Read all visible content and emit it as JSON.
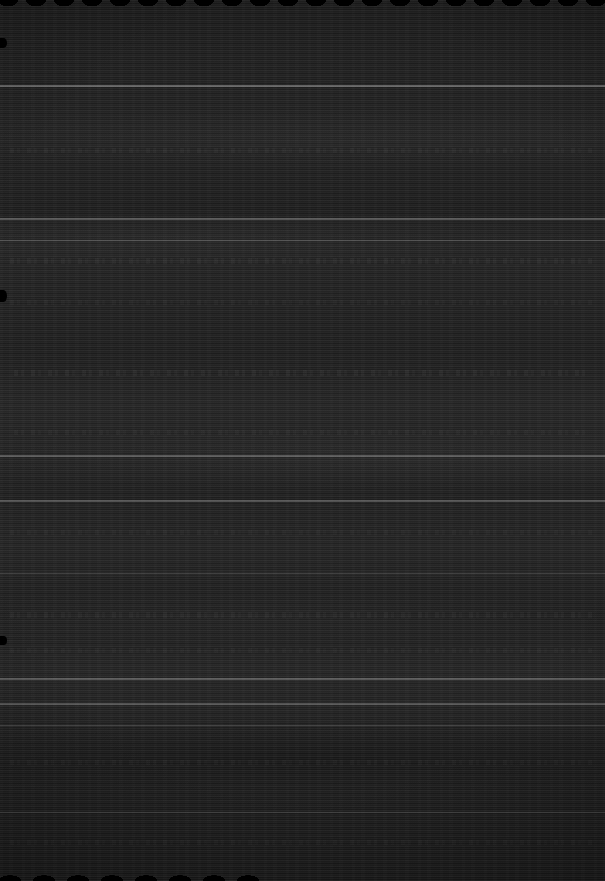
{
  "capture": {
    "width": 605,
    "height": 881,
    "description": "Severely underexposed / degraded screen capture. Surface is near-black with dense horizontal scan-line banding. No legible text, icons, buttons, or color accents are resolvable anywhere in the frame.",
    "legible_text": "",
    "background_color": "#1b1b1b",
    "darkest_color": "#0d0d0d",
    "brightest_color": "#3a3a3a"
  },
  "structure": {
    "separator_rules": [
      {
        "name": "rule-top",
        "y": 85,
        "height": 2,
        "opacity": 0.3
      },
      {
        "name": "rule-upper",
        "y": 218,
        "height": 2,
        "opacity": 0.26
      },
      {
        "name": "rule-upper-b",
        "y": 240,
        "height": 1,
        "opacity": 0.18
      },
      {
        "name": "rule-mid-a",
        "y": 455,
        "height": 2,
        "opacity": 0.24
      },
      {
        "name": "rule-mid-b",
        "y": 500,
        "height": 2,
        "opacity": 0.22
      },
      {
        "name": "rule-mid-c",
        "y": 573,
        "height": 1,
        "opacity": 0.16
      },
      {
        "name": "rule-lower-a",
        "y": 678,
        "height": 2,
        "opacity": 0.26
      },
      {
        "name": "rule-lower-b",
        "y": 703,
        "height": 2,
        "opacity": 0.24
      },
      {
        "name": "rule-lower-c",
        "y": 725,
        "height": 1,
        "opacity": 0.16
      },
      {
        "name": "rule-bottom",
        "y": 812,
        "height": 1,
        "opacity": 0.14
      }
    ],
    "texture_rows": [
      {
        "name": "texture-row-1",
        "y": 148,
        "x": 10,
        "width": 585,
        "height": 5,
        "opacity": 0.5
      },
      {
        "name": "texture-row-2",
        "y": 258,
        "x": 10,
        "width": 585,
        "height": 6,
        "opacity": 0.55
      },
      {
        "name": "texture-row-3",
        "y": 300,
        "x": 10,
        "width": 585,
        "height": 5,
        "opacity": 0.42
      },
      {
        "name": "texture-row-4",
        "y": 370,
        "x": 14,
        "width": 578,
        "height": 6,
        "opacity": 0.62
      },
      {
        "name": "texture-row-5",
        "y": 430,
        "x": 14,
        "width": 578,
        "height": 5,
        "opacity": 0.46
      },
      {
        "name": "texture-row-6",
        "y": 530,
        "x": 10,
        "width": 585,
        "height": 5,
        "opacity": 0.4
      },
      {
        "name": "texture-row-7",
        "y": 612,
        "x": 10,
        "width": 585,
        "height": 6,
        "opacity": 0.52
      },
      {
        "name": "texture-row-8",
        "y": 648,
        "x": 10,
        "width": 585,
        "height": 5,
        "opacity": 0.38
      },
      {
        "name": "texture-row-9",
        "y": 760,
        "x": 10,
        "width": 585,
        "height": 5,
        "opacity": 0.44
      },
      {
        "name": "texture-row-10",
        "y": 840,
        "x": 10,
        "width": 585,
        "height": 5,
        "opacity": 0.4
      }
    ],
    "edge_artifacts": [
      {
        "name": "top-scalloped-edge",
        "edge": "top"
      },
      {
        "name": "bottom-scalloped-edge",
        "edge": "bottom-left"
      },
      {
        "name": "left-notch-upper",
        "edge": "left",
        "y": 38,
        "height": 10
      },
      {
        "name": "left-notch-mid",
        "edge": "left",
        "y": 290,
        "height": 12
      },
      {
        "name": "left-notch-lower",
        "edge": "left",
        "y": 636,
        "height": 9
      }
    ]
  }
}
